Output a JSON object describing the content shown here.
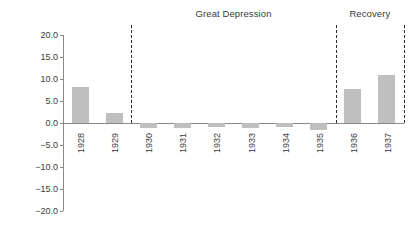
{
  "chart_data": {
    "type": "bar",
    "title": "",
    "xlabel": "",
    "ylabel": "",
    "ylim": [
      -20.0,
      20.0
    ],
    "ytick_step": 5.0,
    "grid": false,
    "legend": null,
    "categories": [
      "1928",
      "1929",
      "1930",
      "1931",
      "1932",
      "1933",
      "1934",
      "1935",
      "1936",
      "1937"
    ],
    "values": [
      8.2,
      2.2,
      -1.2,
      -1.1,
      -1.0,
      -1.2,
      -1.0,
      -1.5,
      7.7,
      10.8
    ],
    "ytick_labels": [
      "20.0",
      "15.0",
      "10.0",
      "5.0",
      "0.0",
      "−5.0",
      "−10.0",
      "−15.0",
      "−20.0"
    ],
    "ytick_values": [
      20.0,
      15.0,
      10.0,
      5.0,
      0.0,
      -5.0,
      -10.0,
      -15.0,
      -20.0
    ],
    "bar_color": "#bfbfbf",
    "axis_color": "#8a8a8a",
    "text_color": "#3b3b3b",
    "annotations": [
      {
        "label": "Great Depression",
        "start_category": "1930",
        "end_category": "1935"
      },
      {
        "label": "Recovery",
        "start_category": "1936",
        "end_category": "1937"
      }
    ],
    "separator_lines": [
      {
        "name": "depression-start",
        "after_category": "1929"
      },
      {
        "name": "depression-end",
        "after_category": "1935"
      },
      {
        "name": "recovery-end",
        "after_category": "1937"
      }
    ]
  }
}
